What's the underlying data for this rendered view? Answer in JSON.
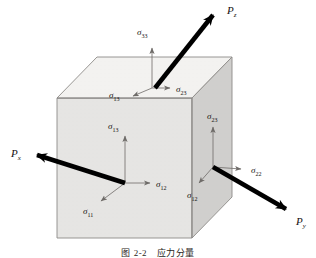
{
  "figure": {
    "caption": "图 2-2　应力分量",
    "background_color": "#ffffff"
  },
  "cube": {
    "top_face_color": "#f2f1ef",
    "front_face_color": "#e4e3e1",
    "right_face_color": "#cfcecc",
    "edge_color": "#8d8b88",
    "geometry": {
      "front_top_left": [
        57,
        98
      ],
      "front_top_right": [
        192,
        98
      ],
      "front_bottom_left": [
        57,
        238
      ],
      "front_bottom_right": [
        192,
        238
      ],
      "back_top_left": [
        97,
        57
      ],
      "back_top_right": [
        232,
        57
      ],
      "back_bottom_right": [
        232,
        197
      ]
    }
  },
  "forces": [
    {
      "id": "force-pz",
      "label_base": "P",
      "label_sub": "z",
      "label_x": 227,
      "label_y": 14,
      "from": [
        155,
        88
      ],
      "to": [
        216,
        11
      ],
      "direction": "up-right-out",
      "color": "#000000"
    },
    {
      "id": "force-px",
      "label_base": "P",
      "label_sub": "x",
      "label_x": 12,
      "label_y": 157,
      "from": [
        125,
        183
      ],
      "to": [
        32,
        154
      ],
      "direction": "left-out",
      "color": "#000000"
    },
    {
      "id": "force-py",
      "label_base": "P",
      "label_sub": "y",
      "label_x": 297,
      "label_y": 224,
      "from": [
        213,
        167
      ],
      "to": [
        291,
        212
      ],
      "direction": "down-right-out",
      "color": "#000000"
    }
  ],
  "stress_components": [
    {
      "id": "sigma-33",
      "base": "σ",
      "sub": "33",
      "label_x": 138,
      "label_y": 34,
      "arrow_from": [
        152,
        88
      ],
      "arrow_to": [
        152,
        46
      ],
      "face": "top",
      "note": "normal stress on top face, pointing up"
    },
    {
      "id": "sigma-13-top",
      "base": "σ",
      "sub": "13",
      "label_x": 110,
      "label_y": 95,
      "arrow_from": [
        152,
        88
      ],
      "arrow_to": [
        131,
        97
      ],
      "face": "top",
      "note": "shear on top face toward x"
    },
    {
      "id": "sigma-23-top",
      "base": "σ",
      "sub": "23",
      "label_x": 177,
      "label_y": 91,
      "arrow_from": [
        152,
        88
      ],
      "arrow_to": [
        172,
        88
      ],
      "face": "top",
      "note": "shear on top face toward y"
    },
    {
      "id": "sigma-13-front",
      "base": "σ",
      "sub": "13",
      "label_x": 108,
      "label_y": 127,
      "arrow_from": [
        125,
        183
      ],
      "arrow_to": [
        125,
        134
      ],
      "face": "front",
      "note": "shear on front (x-normal) face toward z"
    },
    {
      "id": "sigma-12-front",
      "base": "σ",
      "sub": "12",
      "label_x": 157,
      "label_y": 187,
      "arrow_from": [
        125,
        183
      ],
      "arrow_to": [
        152,
        183
      ],
      "face": "front",
      "note": "shear on front face toward y"
    },
    {
      "id": "sigma-11",
      "base": "σ",
      "sub": "11",
      "label_x": 84,
      "label_y": 213,
      "arrow_from": [
        125,
        183
      ],
      "arrow_to": [
        99,
        203
      ],
      "face": "front",
      "note": "normal stress on front face"
    },
    {
      "id": "sigma-23-right",
      "base": "σ",
      "sub": "23",
      "label_x": 209,
      "label_y": 117,
      "arrow_from": [
        213,
        167
      ],
      "arrow_to": [
        213,
        125
      ],
      "face": "right",
      "note": "shear on right (y-normal) face toward z"
    },
    {
      "id": "sigma-22",
      "base": "σ",
      "sub": "22",
      "label_x": 252,
      "label_y": 172,
      "arrow_from": [
        213,
        167
      ],
      "arrow_to": [
        243,
        169
      ],
      "face": "right",
      "note": "normal stress on right face"
    },
    {
      "id": "sigma-12-right",
      "base": "σ",
      "sub": "12",
      "label_x": 188,
      "label_y": 196,
      "arrow_from": [
        213,
        167
      ],
      "arrow_to": [
        197,
        185
      ],
      "face": "right",
      "note": "shear on right face toward x"
    }
  ]
}
